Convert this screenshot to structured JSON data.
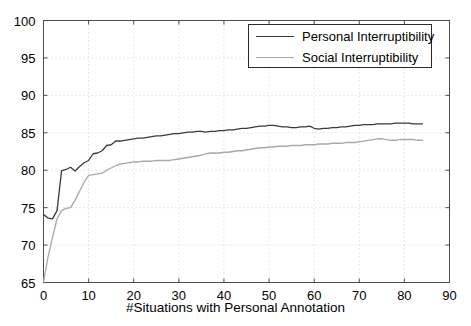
{
  "chart_data": {
    "type": "line",
    "title": "",
    "xlabel": "#Situations with Personal Annotation",
    "ylabel": "",
    "xlim": [
      0,
      90
    ],
    "ylim": [
      65,
      100
    ],
    "xticks": [
      0,
      10,
      20,
      30,
      40,
      50,
      60,
      70,
      80,
      90
    ],
    "yticks": [
      65,
      70,
      75,
      80,
      85,
      90,
      95,
      100
    ],
    "xtick_labels": [
      "0",
      "10",
      "20",
      "30",
      "40",
      "50",
      "60",
      "70",
      "80",
      "90"
    ],
    "ytick_labels": [
      "65",
      "70",
      "75",
      "80",
      "85",
      "90",
      "95",
      "100"
    ],
    "grid": true,
    "grid_style": "dotted",
    "legend_position": "upper right",
    "series": [
      {
        "name": "Personal Interruptibility",
        "color": "#3a3a3a",
        "x": [
          0,
          1,
          2,
          3,
          4,
          5,
          6,
          7,
          8,
          9,
          10,
          11,
          12,
          13,
          14,
          15,
          16,
          17,
          18,
          19,
          20,
          21,
          22,
          23,
          24,
          25,
          26,
          27,
          28,
          29,
          30,
          31,
          32,
          33,
          34,
          35,
          36,
          37,
          38,
          39,
          40,
          41,
          42,
          43,
          44,
          45,
          46,
          47,
          48,
          49,
          50,
          51,
          52,
          53,
          54,
          55,
          56,
          57,
          58,
          59,
          60,
          61,
          62,
          63,
          64,
          65,
          66,
          67,
          68,
          69,
          70,
          71,
          72,
          73,
          74,
          75,
          76,
          77,
          78,
          79,
          80,
          81,
          82,
          83,
          84
        ],
        "y": [
          74.1,
          73.6,
          73.5,
          74.6,
          79.9,
          80.1,
          80.4,
          79.9,
          80.5,
          81.0,
          81.3,
          82.2,
          82.3,
          82.6,
          83.3,
          83.4,
          83.9,
          83.9,
          84.0,
          84.1,
          84.2,
          84.3,
          84.3,
          84.4,
          84.5,
          84.6,
          84.6,
          84.7,
          84.8,
          84.9,
          84.9,
          85.0,
          85.1,
          85.1,
          85.2,
          85.2,
          85.1,
          85.2,
          85.2,
          85.3,
          85.3,
          85.4,
          85.4,
          85.5,
          85.6,
          85.6,
          85.7,
          85.8,
          85.9,
          85.9,
          86.0,
          86.0,
          85.9,
          85.8,
          85.8,
          85.7,
          85.7,
          85.8,
          85.8,
          85.9,
          85.6,
          85.5,
          85.6,
          85.6,
          85.7,
          85.7,
          85.8,
          85.8,
          85.9,
          86.0,
          86.0,
          86.1,
          86.1,
          86.1,
          86.2,
          86.2,
          86.2,
          86.2,
          86.3,
          86.3,
          86.3,
          86.3,
          86.2,
          86.2,
          86.2
        ]
      },
      {
        "name": "Social Interruptibility",
        "color": "#a8a8a8",
        "x": [
          0,
          1,
          2,
          3,
          4,
          5,
          6,
          7,
          8,
          9,
          10,
          11,
          12,
          13,
          14,
          15,
          16,
          17,
          18,
          19,
          20,
          21,
          22,
          23,
          24,
          25,
          26,
          27,
          28,
          29,
          30,
          31,
          32,
          33,
          34,
          35,
          36,
          37,
          38,
          39,
          40,
          41,
          42,
          43,
          44,
          45,
          46,
          47,
          48,
          49,
          50,
          51,
          52,
          53,
          54,
          55,
          56,
          57,
          58,
          59,
          60,
          61,
          62,
          63,
          64,
          65,
          66,
          67,
          68,
          69,
          70,
          71,
          72,
          73,
          74,
          75,
          76,
          77,
          78,
          79,
          80,
          81,
          82,
          83,
          84
        ],
        "y": [
          65.1,
          68.4,
          71.0,
          73.5,
          74.6,
          74.9,
          75.0,
          76.0,
          77.2,
          78.4,
          79.3,
          79.4,
          79.5,
          79.6,
          80.0,
          80.3,
          80.6,
          80.8,
          80.9,
          81.0,
          81.1,
          81.1,
          81.2,
          81.2,
          81.2,
          81.3,
          81.3,
          81.3,
          81.3,
          81.4,
          81.5,
          81.6,
          81.7,
          81.8,
          81.9,
          82.0,
          82.2,
          82.3,
          82.3,
          82.3,
          82.4,
          82.4,
          82.5,
          82.6,
          82.6,
          82.7,
          82.8,
          82.9,
          83.0,
          83.0,
          83.1,
          83.1,
          83.2,
          83.2,
          83.2,
          83.3,
          83.3,
          83.3,
          83.4,
          83.4,
          83.4,
          83.5,
          83.5,
          83.5,
          83.6,
          83.6,
          83.6,
          83.7,
          83.7,
          83.7,
          83.8,
          83.9,
          84.0,
          84.1,
          84.2,
          84.2,
          84.1,
          84.0,
          84.0,
          84.1,
          84.1,
          84.1,
          84.1,
          84.0,
          84.0
        ]
      }
    ]
  },
  "legend": {
    "items": [
      {
        "label": "Personal Interruptibility"
      },
      {
        "label": "Social Interruptibility"
      }
    ]
  },
  "axes": {
    "xlabel": "#Situations with Personal Annotation"
  }
}
